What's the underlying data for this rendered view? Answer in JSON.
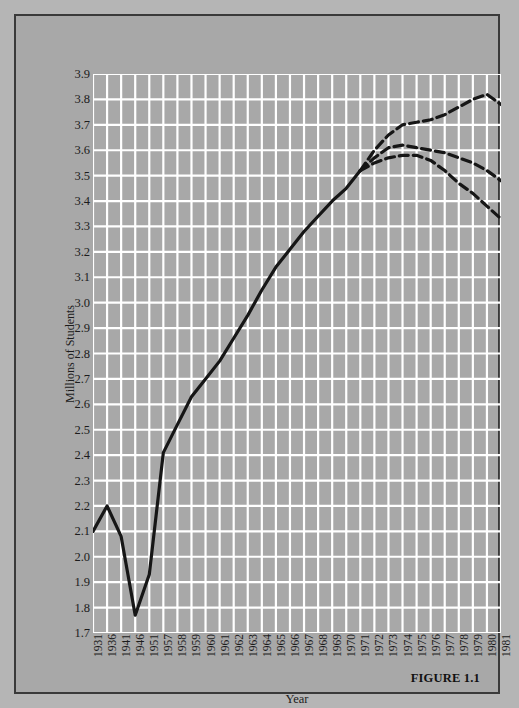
{
  "figure": {
    "caption": "FIGURE 1.1",
    "background_color": "#a8a8a8",
    "grid_color": "#ffffff",
    "line_color": "#161616"
  },
  "chart_data": {
    "type": "line",
    "title": "",
    "subtitle": "",
    "xlabel": "Year",
    "ylabel": "Millions of Students",
    "grid": true,
    "legend": "none",
    "xlim": [
      1931,
      1981
    ],
    "ylim": [
      1.7,
      3.9
    ],
    "ytick_labels": [
      "3.9",
      "3.8",
      "3.7",
      "3.6",
      "3.5",
      "3.4",
      "3.3",
      "3.2",
      "3.1",
      "3.0",
      "2.9",
      "2.8",
      "2.7",
      "2.6",
      "2.5",
      "2.4",
      "2.3",
      "2.2",
      "2.1",
      "2.0",
      "1.9",
      "1.8",
      "1.7"
    ],
    "ytick_values": [
      3.9,
      3.8,
      3.7,
      3.6,
      3.5,
      3.4,
      3.3,
      3.2,
      3.1,
      3.0,
      2.9,
      2.8,
      2.7,
      2.6,
      2.5,
      2.4,
      2.3,
      2.2,
      2.1,
      2.0,
      1.9,
      1.8,
      1.7
    ],
    "xtick_labels": [
      "1931",
      "1936",
      "1941",
      "1946",
      "1951",
      "1957",
      "1958",
      "1959",
      "1960",
      "1961",
      "1962",
      "1963",
      "1964",
      "1965",
      "1966",
      "1967",
      "1968",
      "1969",
      "1970",
      "1971",
      "1972",
      "1973",
      "1974",
      "1975",
      "1976",
      "1977",
      "1978",
      "1979",
      "1980",
      "1981"
    ],
    "xtick_slots": [
      0,
      1,
      2,
      3,
      4,
      5,
      6,
      7,
      8,
      9,
      10,
      11,
      12,
      13,
      14,
      15,
      16,
      17,
      18,
      19,
      20,
      21,
      22,
      23,
      24,
      25,
      26,
      27,
      28,
      29
    ],
    "series": [
      {
        "name": "Actual enrollment",
        "style": "solid",
        "x_slots": [
          0,
          1,
          2,
          3,
          4,
          5,
          6,
          7,
          8,
          9,
          10,
          11,
          12,
          13,
          14,
          15,
          16,
          17,
          18,
          19
        ],
        "values": [
          2.1,
          2.2,
          2.08,
          1.77,
          1.93,
          2.41,
          2.52,
          2.63,
          2.7,
          2.77,
          2.86,
          2.95,
          3.05,
          3.14,
          3.21,
          3.28,
          3.34,
          3.4,
          3.45,
          3.52
        ]
      },
      {
        "name": "High projection",
        "style": "dashed",
        "x_slots": [
          19,
          20,
          21,
          22,
          23,
          24,
          25,
          26,
          27,
          28,
          29
        ],
        "values": [
          3.52,
          3.6,
          3.66,
          3.7,
          3.71,
          3.72,
          3.74,
          3.77,
          3.8,
          3.82,
          3.78
        ]
      },
      {
        "name": "Middle projection",
        "style": "dashed",
        "x_slots": [
          19,
          20,
          21,
          22,
          23,
          24,
          25,
          26,
          27,
          28,
          29
        ],
        "values": [
          3.52,
          3.57,
          3.61,
          3.62,
          3.61,
          3.6,
          3.59,
          3.57,
          3.55,
          3.52,
          3.48
        ]
      },
      {
        "name": "Low projection",
        "style": "dashed",
        "x_slots": [
          19,
          20,
          21,
          22,
          23,
          24,
          25,
          26,
          27,
          28,
          29
        ],
        "values": [
          3.52,
          3.55,
          3.57,
          3.58,
          3.58,
          3.56,
          3.52,
          3.47,
          3.43,
          3.38,
          3.33
        ]
      }
    ]
  }
}
